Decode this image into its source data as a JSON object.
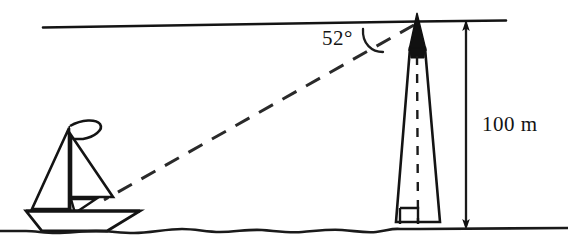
{
  "figure": {
    "background_color": "#ffffff",
    "ink_color": "#141414",
    "width": 568,
    "height": 252
  },
  "labels": {
    "angle": "52°",
    "height": "100 m"
  },
  "elements": {
    "horizon_line_name": "horizontal-reference-line",
    "sight_line_name": "line-of-sight-dashed",
    "tower_name": "lighthouse-tower",
    "tower_axis_name": "tower-center-axis-dashed",
    "tower_cap_name": "tower-spire-cap",
    "boat_name": "sailboat",
    "water_name": "water-surface-line",
    "dimension_name": "height-dimension-arrow",
    "right_angle_name": "right-angle-marker",
    "angle_arc_name": "angle-arc"
  },
  "geometry": {
    "tower_top_x": 417,
    "tower_top_y": 22,
    "tower_base_y": 222,
    "tower_base_left_x": 396,
    "tower_base_right_x": 440,
    "horizon_y": 22,
    "angle_degrees": 52,
    "height_meters": 100,
    "dimension_line_x": 466,
    "boat_hull_left_x": 26,
    "boat_hull_right_x": 140,
    "water_y": 228
  }
}
